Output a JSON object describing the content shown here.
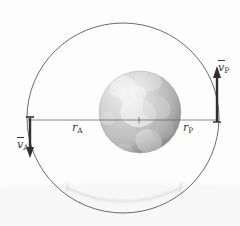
{
  "figure": {
    "kind": "orbital-mechanics-diagram",
    "background_color": "#fdfdfd",
    "title_visible": false
  },
  "labels": {
    "r_apogee": {
      "symbol": "r",
      "subscript": "A"
    },
    "r_perigee": {
      "symbol": "r",
      "subscript": "P"
    },
    "v_apogee": {
      "symbol": "v",
      "subscript": "A"
    },
    "v_perigee": {
      "symbol": "v",
      "subscript": "P"
    }
  },
  "colors": {
    "orbit_stroke": "#555555",
    "axis_line": "#666666",
    "arrow": "#2f2f2f",
    "label_text": "#3a3a3a",
    "globe_light": "#d8d8d8",
    "globe_mid": "#b4b4b4",
    "globe_dark": "#8d8d8d",
    "globe_edge": "#9a9a9a",
    "faint_arc": "#c9c9c9"
  },
  "geometry": {
    "orbit_center": {
      "x": 123,
      "y": 118
    },
    "orbit_semi_major": 96,
    "orbit_semi_minor": 96,
    "globe_center": {
      "x": 140,
      "y": 112
    },
    "globe_radius": 41,
    "axis_line": {
      "x1": 28,
      "y1": 120,
      "x2": 219,
      "y2": 120
    },
    "arrow_apogee": {
      "x": 30,
      "y_start": 120,
      "y_end": 156,
      "direction": "down"
    },
    "arrow_perigee": {
      "x": 217,
      "y_start": 122,
      "y_end": 67,
      "direction": "up"
    }
  }
}
